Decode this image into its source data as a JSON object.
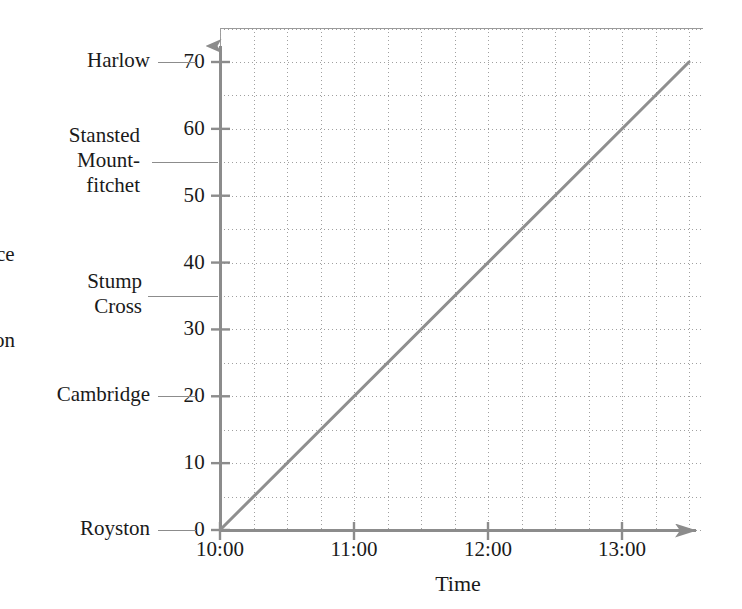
{
  "chart_data": {
    "type": "line",
    "title": "",
    "xlabel": "Time",
    "ylabel": "Distance",
    "grid": true,
    "legend": "none",
    "x_tick_labels": [
      "10:00",
      "11:00",
      "12:00",
      "13:00"
    ],
    "x_tick_values": [
      10,
      11,
      12,
      13
    ],
    "xlim": [
      10,
      13.6
    ],
    "x_minor_step_minutes": 15,
    "y_tick_labels": [
      "0",
      "10",
      "20",
      "30",
      "40",
      "50",
      "60",
      "70"
    ],
    "y_tick_values": [
      0,
      10,
      20,
      30,
      40,
      50,
      60,
      70
    ],
    "ylim": [
      0,
      75
    ],
    "y_minor_step": 5,
    "series": [
      {
        "name": "journey",
        "points": [
          {
            "x": "10:00",
            "x_value": 10.0,
            "y": 0
          },
          {
            "x": "13:30",
            "x_value": 13.5,
            "y": 70
          }
        ],
        "color": "#8f8f8f",
        "style": "solid",
        "width": 3
      }
    ],
    "reference_markers": [
      {
        "label": "Harlow",
        "value": 70
      },
      {
        "label": "Stansted\nMount-\nfitchet",
        "value": 55
      },
      {
        "label": "Stump\nCross",
        "value": 35
      },
      {
        "label": "Cambridge",
        "value": 20
      },
      {
        "label": "Royston",
        "value": 0
      }
    ],
    "clipped_text_fragments": [
      {
        "text": "ce",
        "approx_y_value": 41
      },
      {
        "text": "on",
        "approx_y_value": 28
      }
    ],
    "colors": {
      "line": "#8f8f8f",
      "axis": "#8c8c8c",
      "grid": "#a0a0a0",
      "text": "#1a1a1a",
      "leader": "#8c8c8c"
    }
  },
  "axis": {
    "x_title": "Time",
    "y_title_fragment_upper": "ce",
    "y_title_fragment_lower": "on"
  }
}
